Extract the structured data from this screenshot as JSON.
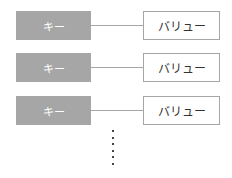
{
  "diagram": {
    "type": "key-value-list",
    "rows": [
      {
        "key": "キー",
        "value": "バリュー"
      },
      {
        "key": "キー",
        "value": "バリュー"
      },
      {
        "key": "キー",
        "value": "バリュー"
      }
    ],
    "continuation": "vertical-ellipsis",
    "colors": {
      "key_fill": "#a6a6a6",
      "key_text": "#ffffff",
      "value_border": "#a6a6a6",
      "value_text": "#333333",
      "connector": "#a6a6a6"
    }
  }
}
